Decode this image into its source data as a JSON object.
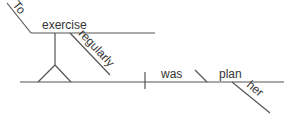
{
  "diagram": {
    "type": "sentence-diagram",
    "sentence": "To exercise regularly was her plan",
    "words": {
      "to": "To",
      "exercise": "exercise",
      "regularly": "regularly",
      "was": "was",
      "plan": "plan",
      "her": "her"
    },
    "line_color": "#555555",
    "text_color": "#333333"
  }
}
